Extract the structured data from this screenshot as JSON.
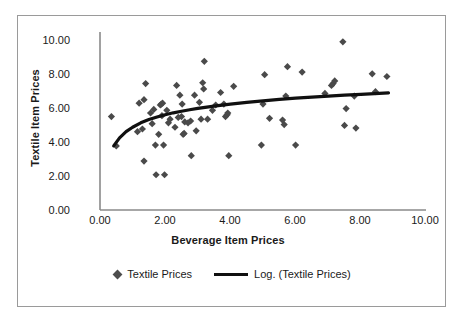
{
  "chart_data": {
    "type": "scatter",
    "title": "",
    "xlabel": "Beverage Item Prices",
    "ylabel": "Textile Item Prices",
    "xlim": [
      0,
      10
    ],
    "ylim": [
      0,
      10
    ],
    "xticks": [
      "0.00",
      "2.00",
      "4.00",
      "6.00",
      "8.00",
      "10.00"
    ],
    "yticks": [
      "0.00",
      "2.00",
      "4.00",
      "6.00",
      "8.00",
      "10.00"
    ],
    "grid": false,
    "legend_position": "bottom",
    "series": [
      {
        "name": "Textile Prices",
        "type": "scatter",
        "marker": "diamond",
        "color": "#4a4a4a",
        "points": [
          [
            0.35,
            5.25
          ],
          [
            0.5,
            3.6
          ],
          [
            1.15,
            4.4
          ],
          [
            1.2,
            6.0
          ],
          [
            1.3,
            4.55
          ],
          [
            1.35,
            6.2
          ],
          [
            1.4,
            7.1
          ],
          [
            1.35,
            2.75
          ],
          [
            1.55,
            5.45
          ],
          [
            1.6,
            4.85
          ],
          [
            1.65,
            5.65
          ],
          [
            1.7,
            3.65
          ],
          [
            1.72,
            1.98
          ],
          [
            1.8,
            4.25
          ],
          [
            1.85,
            5.9
          ],
          [
            1.88,
            5.95
          ],
          [
            1.9,
            5.3
          ],
          [
            1.92,
            6.0
          ],
          [
            1.95,
            3.65
          ],
          [
            1.98,
            1.98
          ],
          [
            2.05,
            5.6
          ],
          [
            2.1,
            4.9
          ],
          [
            2.15,
            5.1
          ],
          [
            2.3,
            4.65
          ],
          [
            2.35,
            7.0
          ],
          [
            2.4,
            5.2
          ],
          [
            2.45,
            6.45
          ],
          [
            2.5,
            5.25
          ],
          [
            2.52,
            5.95
          ],
          [
            2.55,
            4.25
          ],
          [
            2.58,
            4.3
          ],
          [
            2.6,
            4.95
          ],
          [
            2.7,
            4.9
          ],
          [
            2.78,
            5.0
          ],
          [
            2.8,
            3.05
          ],
          [
            2.9,
            6.45
          ],
          [
            2.95,
            4.45
          ],
          [
            3.05,
            6.05
          ],
          [
            3.1,
            5.1
          ],
          [
            3.15,
            7.15
          ],
          [
            3.18,
            6.8
          ],
          [
            3.2,
            8.35
          ],
          [
            3.3,
            5.1
          ],
          [
            3.45,
            5.6
          ],
          [
            3.55,
            5.9
          ],
          [
            3.7,
            6.6
          ],
          [
            3.8,
            5.95
          ],
          [
            3.85,
            5.25
          ],
          [
            3.9,
            5.35
          ],
          [
            3.92,
            5.45
          ],
          [
            3.95,
            3.05
          ],
          [
            4.1,
            6.95
          ],
          [
            4.95,
            3.65
          ],
          [
            5.0,
            5.95
          ],
          [
            5.05,
            7.6
          ],
          [
            5.2,
            5.15
          ],
          [
            5.6,
            5.05
          ],
          [
            5.65,
            4.8
          ],
          [
            5.7,
            6.4
          ],
          [
            5.75,
            8.05
          ],
          [
            6.0,
            3.65
          ],
          [
            6.2,
            7.75
          ],
          [
            6.9,
            6.55
          ],
          [
            7.1,
            7.0
          ],
          [
            7.15,
            7.1
          ],
          [
            7.2,
            7.25
          ],
          [
            7.45,
            9.45
          ],
          [
            7.5,
            4.75
          ],
          [
            7.55,
            5.7
          ],
          [
            7.8,
            6.4
          ],
          [
            7.85,
            4.6
          ],
          [
            8.35,
            7.65
          ],
          [
            8.45,
            6.65
          ],
          [
            8.8,
            7.5
          ]
        ]
      },
      {
        "name": "Log. (Textile Prices)",
        "type": "line",
        "fit": "logarithmic",
        "color": "#101010",
        "x_range": [
          0.42,
          8.85
        ],
        "points": [
          [
            0.42,
            3.6
          ],
          [
            0.6,
            4.05
          ],
          [
            0.8,
            4.4
          ],
          [
            1.0,
            4.65
          ],
          [
            1.25,
            4.9
          ],
          [
            1.5,
            5.08
          ],
          [
            1.75,
            5.22
          ],
          [
            2.0,
            5.35
          ],
          [
            2.25,
            5.46
          ],
          [
            2.5,
            5.55
          ],
          [
            2.75,
            5.63
          ],
          [
            3.0,
            5.71
          ],
          [
            3.5,
            5.84
          ],
          [
            4.0,
            5.95
          ],
          [
            4.5,
            6.05
          ],
          [
            5.0,
            6.13
          ],
          [
            5.5,
            6.21
          ],
          [
            6.0,
            6.28
          ],
          [
            6.5,
            6.34
          ],
          [
            7.0,
            6.4
          ],
          [
            7.5,
            6.45
          ],
          [
            8.0,
            6.5
          ],
          [
            8.85,
            6.58
          ]
        ]
      }
    ]
  },
  "axes": {
    "y_title": "Textile Item Prices",
    "x_title": "Beverage Item Prices",
    "y_ticks": [
      "10.00",
      "8.00",
      "6.00",
      "4.00",
      "2.00",
      "0.00"
    ],
    "x_ticks": [
      "0.00",
      "2.00",
      "4.00",
      "6.00",
      "8.00",
      "10.00"
    ]
  },
  "legend": {
    "items": [
      {
        "label": "Textile Prices",
        "marker": "diamond-marker"
      },
      {
        "label": "Log. (Textile Prices)",
        "marker": "line-marker"
      }
    ]
  },
  "colors": {
    "marker": "#4a4a4a",
    "trendline": "#101010",
    "axis": "#8a8a8a",
    "border": "#9a9a9a",
    "text": "#1a1a1a"
  }
}
